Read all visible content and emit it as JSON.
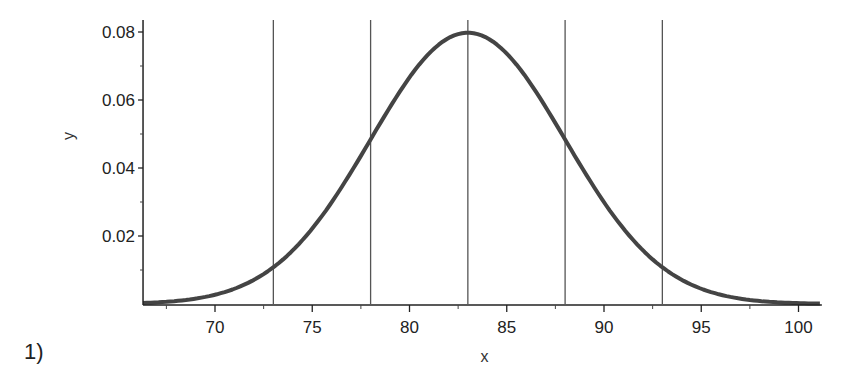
{
  "problem_label": "1)",
  "chart_data": {
    "type": "line",
    "title": "",
    "xlabel": "x",
    "ylabel": "y",
    "xlim": [
      66.3,
      101.2
    ],
    "ylim": [
      0,
      0.083
    ],
    "x_ticks": [
      70,
      75,
      80,
      85,
      90,
      95,
      100
    ],
    "x_minor_ticks": [
      67.5,
      72.5,
      77.5,
      82.5,
      87.5,
      92.5,
      97.5
    ],
    "y_ticks": [
      0.02,
      0.04,
      0.06,
      0.08
    ],
    "y_tick_labels": [
      "0.02",
      "0.04",
      "0.06",
      "0.08"
    ],
    "y_minor_ticks": [
      0.01,
      0.03,
      0.05,
      0.07
    ],
    "grid": false,
    "legend": null,
    "series": [
      {
        "name": "normal density",
        "distribution": "Normal(mean=83, sd=5)",
        "mean": 83,
        "sd": 5,
        "x": [
          66.3,
          68,
          70,
          72,
          73,
          74,
          76,
          78,
          80,
          82,
          83,
          84,
          86,
          88,
          90,
          92,
          93,
          94,
          96,
          98,
          100,
          101.2
        ],
        "values": [
          0.0003,
          0.0009,
          0.0027,
          0.0071,
          0.0108,
          0.0158,
          0.03,
          0.0484,
          0.0666,
          0.0782,
          0.0798,
          0.0782,
          0.0666,
          0.0484,
          0.03,
          0.0158,
          0.0108,
          0.0071,
          0.0027,
          0.0009,
          0.0002,
          0.0001
        ]
      }
    ],
    "vertical_lines": [
      73,
      78,
      83,
      88,
      93
    ],
    "annotations": []
  }
}
